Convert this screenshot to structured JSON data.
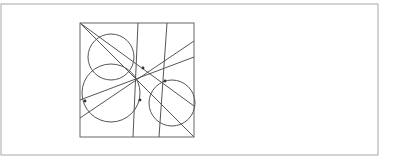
{
  "figure": {
    "background_color": "#ffffff",
    "canvas": {
      "width": 401,
      "height": 159
    },
    "outer_frame": {
      "name": "outer-frame",
      "x": 1,
      "y": 4,
      "width": 377,
      "height": 151,
      "stroke": "#a8a8a8",
      "stroke_width": 1
    },
    "inner_square": {
      "name": "inner-square",
      "x": 80,
      "y": 23,
      "width": 114,
      "height": 114,
      "stroke": "#666666",
      "stroke_width": 1
    },
    "circles": [
      {
        "name": "circle-upper-left",
        "cx": 111,
        "cy": 57,
        "r": 23,
        "stroke": "#555555",
        "stroke_width": 1
      },
      {
        "name": "circle-lower-left",
        "cx": 111,
        "cy": 93,
        "r": 29,
        "stroke": "#555555",
        "stroke_width": 1
      },
      {
        "name": "circle-lower-right",
        "cx": 172,
        "cy": 103,
        "r": 23,
        "stroke": "#555555",
        "stroke_width": 1
      }
    ],
    "lines": [
      {
        "name": "line-main-diagonal",
        "x1": 80,
        "y1": 23,
        "x2": 194,
        "y2": 137,
        "stroke": "#555555",
        "stroke_width": 1
      },
      {
        "name": "line-upper-diagonal",
        "x1": 80,
        "y1": 23,
        "x2": 194,
        "y2": 106,
        "stroke": "#555555",
        "stroke_width": 1
      },
      {
        "name": "line-rising-diagonal",
        "x1": 80,
        "y1": 118,
        "x2": 194,
        "y2": 41,
        "stroke": "#555555",
        "stroke_width": 1
      },
      {
        "name": "line-shallow-rising",
        "x1": 80,
        "y1": 100,
        "x2": 194,
        "y2": 57,
        "stroke": "#555555",
        "stroke_width": 1
      },
      {
        "name": "line-vertical-left",
        "x1": 138,
        "y1": 23,
        "x2": 133,
        "y2": 137,
        "stroke": "#555555",
        "stroke_width": 1
      },
      {
        "name": "line-vertical-right",
        "x1": 167,
        "y1": 23,
        "x2": 159,
        "y2": 137,
        "stroke": "#555555",
        "stroke_width": 1
      }
    ],
    "intersection_markers": [
      {
        "name": "node-upper-center",
        "cx": 143,
        "cy": 68,
        "r": 1.4,
        "fill": "#333333"
      },
      {
        "name": "node-mid-right",
        "cx": 165,
        "cy": 81,
        "r": 1.4,
        "fill": "#333333"
      },
      {
        "name": "node-lower-center",
        "cx": 140,
        "cy": 100,
        "r": 1.4,
        "fill": "#333333"
      },
      {
        "name": "node-left-edge",
        "cx": 85,
        "cy": 101,
        "r": 1.4,
        "fill": "#333333"
      }
    ]
  }
}
